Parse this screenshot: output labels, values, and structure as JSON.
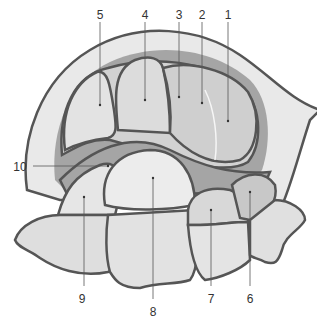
{
  "diagram": {
    "type": "anatomical illustration",
    "colors": {
      "outline": "#555555",
      "dark_fill": "#9a9a9a",
      "mid_fill": "#c4c4c4",
      "light_fill": "#e6e6e6",
      "highlight": "#f6f6f6",
      "label_text": "#333333"
    },
    "labels": [
      {
        "id": "1",
        "text": "1",
        "x": 228,
        "y": 9,
        "pointer": [
          228,
          22,
          228,
          121
        ]
      },
      {
        "id": "2",
        "text": "2",
        "x": 202,
        "y": 9,
        "pointer": [
          202,
          22,
          202,
          103
        ]
      },
      {
        "id": "3",
        "text": "3",
        "x": 179,
        "y": 9,
        "pointer": [
          179,
          22,
          179,
          97
        ]
      },
      {
        "id": "4",
        "text": "4",
        "x": 145,
        "y": 9,
        "pointer": [
          145,
          22,
          145,
          100
        ]
      },
      {
        "id": "5",
        "text": "5",
        "x": 100,
        "y": 9,
        "pointer": [
          100,
          22,
          100,
          105
        ]
      },
      {
        "id": "10",
        "text": "10",
        "x": 20,
        "y": 161,
        "pointer": [
          33,
          166,
          108,
          166
        ]
      },
      {
        "id": "9",
        "text": "9",
        "x": 82,
        "y": 293,
        "pointer": [
          84,
          286,
          84,
          197
        ]
      },
      {
        "id": "8",
        "text": "8",
        "x": 153,
        "y": 306,
        "pointer": [
          153,
          299,
          153,
          178
        ]
      },
      {
        "id": "7",
        "text": "7",
        "x": 211,
        "y": 293,
        "pointer": [
          211,
          286,
          211,
          210
        ]
      },
      {
        "id": "6",
        "text": "6",
        "x": 250,
        "y": 293,
        "pointer": [
          250,
          286,
          250,
          192
        ]
      }
    ]
  }
}
